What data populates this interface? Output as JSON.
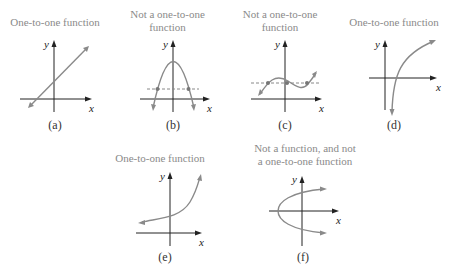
{
  "panels": {
    "a": {
      "title": "One-to-one function",
      "caption": "(a)",
      "x_label": "x",
      "y_label": "y",
      "graph": "increasing line"
    },
    "b": {
      "title_line1": "Not a one-to-one",
      "title_line2": "function",
      "caption": "(b)",
      "x_label": "x",
      "y_label": "y",
      "graph": "downward parabola with horizontal dashed line crossing at 2 points"
    },
    "c": {
      "title_line1": "Not a one-to-one",
      "title_line2": "function",
      "caption": "(c)",
      "x_label": "x",
      "y_label": "y",
      "graph": "cubic wave with horizontal dashed line crossing at 3 points"
    },
    "d": {
      "title": "One-to-one function",
      "caption": "(d)",
      "x_label": "x",
      "y_label": "y",
      "graph": "logarithmic curve"
    },
    "e": {
      "title": "One-to-one function",
      "caption": "(e)",
      "x_label": "x",
      "y_label": "y",
      "graph": "exponential curve"
    },
    "f": {
      "title_line1": "Not a function, and not",
      "title_line2": "a one-to-one function",
      "caption": "(f)",
      "x_label": "x",
      "y_label": "y",
      "graph": "sideways parabola opening right"
    }
  },
  "colors": {
    "curve": "#8a8a8a",
    "axis": "#222222",
    "title": "#8a8a8a"
  }
}
